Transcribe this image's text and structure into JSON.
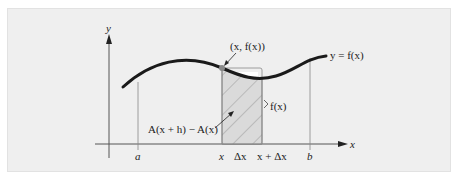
{
  "diagram": {
    "axes": {
      "x_label": "x",
      "y_label": "y"
    },
    "curve_label": "y = f(x)",
    "point_label": "(x, f(x))",
    "height_label": "f(x)",
    "area_label": "A(x + h) − A(x)",
    "ticks": {
      "a": "a",
      "x": "x",
      "dx": "Δx",
      "x_plus_dx": "x + Δx",
      "b": "b"
    },
    "colors": {
      "background": "#efefef",
      "curve": "#1a1a1a",
      "point": "#888888",
      "shading": "#d8d8d8"
    }
  }
}
